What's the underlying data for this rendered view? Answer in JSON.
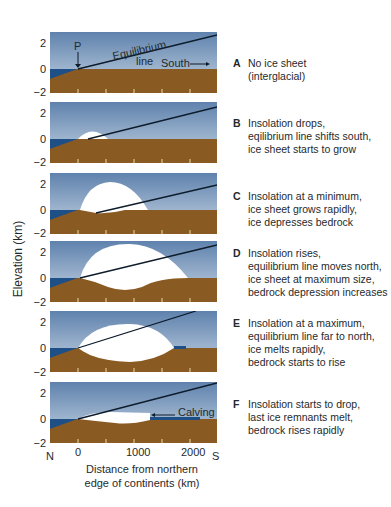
{
  "figure": {
    "y_axis_label": "Elevation (km)",
    "y_ticks": [
      "2",
      "0",
      "−2"
    ],
    "x_ticks": [
      "0",
      "1000",
      "2000"
    ],
    "x_end_labels": {
      "left": "N",
      "right": "S"
    },
    "x_axis_label": "Distance from northern\nedge of continents (km)",
    "colors": {
      "sky_top": "#5f82ad",
      "sky_bottom": "#c8d6e4",
      "bedrock": "#8a5a23",
      "ocean": "#1e4f86",
      "ice": "#ffffff",
      "line": "#0d1b2a"
    },
    "annotations": {
      "p": "P",
      "eq": "Equilibrium",
      "line": "line",
      "south": "South",
      "calving": "Calving"
    }
  },
  "panels": [
    {
      "letter": "A",
      "caption": "No ice sheet\n(interglacial)"
    },
    {
      "letter": "B",
      "caption": "Insolation drops,\neqilibrium line shifts south,\nice sheet starts to grow"
    },
    {
      "letter": "C",
      "caption": "Insolation at a minimum,\nice sheet grows rapidly,\nice depresses bedrock"
    },
    {
      "letter": "D",
      "caption": "Insolation rises,\nequilibrium line moves north,\nice sheet at maximum size,\nbedrock depression increases"
    },
    {
      "letter": "E",
      "caption": "Insolation at a maximum,\nequilibrium line far to north,\nice melts rapidly,\nbedrock starts to rise"
    },
    {
      "letter": "F",
      "caption": "Insolation starts to drop,\nlast ice remnants melt,\nbedrock rises rapidly"
    }
  ]
}
